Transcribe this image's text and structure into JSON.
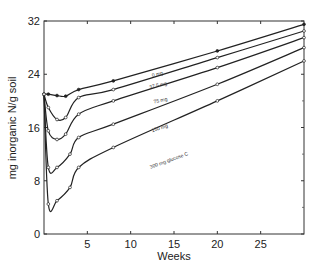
{
  "chart_data": {
    "type": "line",
    "title": "",
    "xlabel": "Weeks",
    "ylabel": "mg inorganic N/g soil",
    "xlim": [
      0,
      30
    ],
    "ylim": [
      0,
      32
    ],
    "xticks": [
      5,
      10,
      15,
      20,
      25
    ],
    "yticks": [
      0,
      8,
      16,
      24,
      32
    ],
    "grid": false,
    "legend": "inline labels on lines",
    "series": [
      {
        "name": "0 mg",
        "marker": "filled",
        "x": [
          0,
          0.5,
          1.5,
          2.5,
          4,
          8,
          20,
          30
        ],
        "values": [
          21,
          21,
          20.8,
          20.7,
          21.7,
          23,
          27.5,
          31.5
        ]
      },
      {
        "name": "37.5 mg",
        "marker": "open",
        "x": [
          0,
          0.5,
          1.5,
          2.5,
          4,
          8,
          20,
          30
        ],
        "values": [
          21,
          19,
          17.2,
          17.5,
          20.5,
          21.7,
          26.5,
          30.5
        ]
      },
      {
        "name": "75 mg",
        "marker": "open",
        "x": [
          0,
          0.5,
          1.5,
          2.5,
          4,
          8,
          20,
          30
        ],
        "values": [
          21,
          15.5,
          14.2,
          15,
          18,
          20,
          25,
          29.5
        ]
      },
      {
        "name": "150 mg",
        "marker": "open",
        "x": [
          0,
          0.5,
          1.5,
          3,
          4,
          8,
          20,
          30
        ],
        "values": [
          21,
          10,
          10,
          12,
          14.5,
          16.5,
          22.5,
          28
        ]
      },
      {
        "name": "300 mg glucose C",
        "marker": "open",
        "x": [
          0,
          0.5,
          1.5,
          3,
          4,
          8,
          20,
          30
        ],
        "values": [
          21,
          4.5,
          5,
          7,
          10,
          13,
          20,
          26
        ]
      }
    ],
    "labels": [
      {
        "text": "0 mg",
        "x": 12.5,
        "y": 23.6,
        "angle": -13
      },
      {
        "text": "37.5 mg",
        "x": 12.2,
        "y": 21.8,
        "angle": -13
      },
      {
        "text": "75 mg",
        "x": 12.7,
        "y": 19.6,
        "angle": -13
      },
      {
        "text": "150 mg",
        "x": 12.5,
        "y": 15.3,
        "angle": -18
      },
      {
        "text": "300 mg glucose C",
        "x": 12.3,
        "y": 9.8,
        "angle": -20
      }
    ]
  }
}
